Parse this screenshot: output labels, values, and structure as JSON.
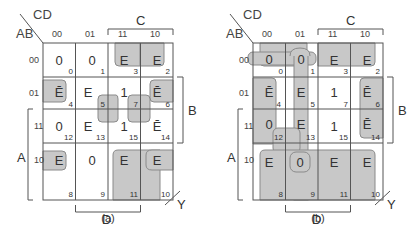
{
  "diagrams": [
    {
      "id": "a",
      "caption": "(a)",
      "corner": {
        "row_var": "AB",
        "col_var": "CD"
      },
      "col_headers": [
        "00",
        "01",
        "11",
        "10"
      ],
      "row_headers": [
        "00",
        "01",
        "11",
        "10"
      ],
      "brackets": {
        "top": "C",
        "right": "B",
        "left": "A",
        "bottom": "D"
      },
      "output_label": "Y",
      "cells": [
        [
          {
            "v": "0",
            "i": "0"
          },
          {
            "v": "0",
            "i": "1"
          },
          {
            "v": "E",
            "i": "3"
          },
          {
            "v": "E",
            "i": "2"
          }
        ],
        [
          {
            "v": "Ē",
            "i": "4"
          },
          {
            "v": "E",
            "i": "5"
          },
          {
            "v": "1",
            "i": "7"
          },
          {
            "v": "Ē",
            "i": "6"
          }
        ],
        [
          {
            "v": "0",
            "i": "12"
          },
          {
            "v": "E",
            "i": "13"
          },
          {
            "v": "1",
            "i": "15"
          },
          {
            "v": "Ē",
            "i": "14"
          }
        ],
        [
          {
            "v": "E",
            "i": "8"
          },
          {
            "v": "0",
            "i": "9"
          },
          {
            "v": "E",
            "i": "11"
          },
          {
            "v": "E",
            "i": "10"
          }
        ]
      ]
    },
    {
      "id": "b",
      "caption": "(b)",
      "corner": {
        "row_var": "AB",
        "col_var": "CD"
      },
      "col_headers": [
        "00",
        "01",
        "11",
        "10"
      ],
      "row_headers": [
        "00",
        "01",
        "11",
        "10"
      ],
      "brackets": {
        "top": "C",
        "right": "B",
        "left": "A",
        "bottom": "D"
      },
      "output_label": "Y",
      "cells": [
        [
          {
            "v": "0",
            "i": "0"
          },
          {
            "v": "0",
            "i": "1"
          },
          {
            "v": "E",
            "i": "3"
          },
          {
            "v": "E",
            "i": "2"
          }
        ],
        [
          {
            "v": "Ē",
            "i": "4"
          },
          {
            "v": "E",
            "i": "5"
          },
          {
            "v": "1",
            "i": "7"
          },
          {
            "v": "Ē",
            "i": "6"
          }
        ],
        [
          {
            "v": "0",
            "i": "12"
          },
          {
            "v": "E",
            "i": "13"
          },
          {
            "v": "1",
            "i": "15"
          },
          {
            "v": "Ē",
            "i": "14"
          }
        ],
        [
          {
            "v": "E",
            "i": "8"
          },
          {
            "v": "0",
            "i": "9"
          },
          {
            "v": "E",
            "i": "11"
          },
          {
            "v": "E",
            "i": "10"
          }
        ]
      ]
    }
  ],
  "colors": {
    "group_fill": "#c8c8c8",
    "group_stroke": "#888888",
    "grid_line": "#555555"
  }
}
